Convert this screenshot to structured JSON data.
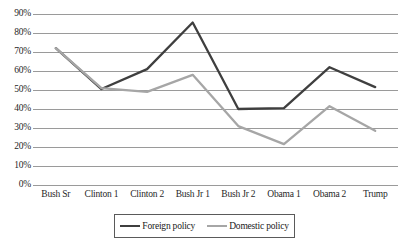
{
  "chart_data": {
    "type": "line",
    "title": "",
    "subtitle": "",
    "xlabel": "",
    "ylabel": "",
    "ylim": [
      0,
      90
    ],
    "ytick_step": 10,
    "ytick_labels": [
      "0%",
      "10%",
      "20%",
      "30%",
      "40%",
      "50%",
      "60%",
      "70%",
      "80%",
      "90%"
    ],
    "ytick_values": [
      0,
      10,
      20,
      30,
      40,
      50,
      60,
      70,
      80,
      90
    ],
    "grid": "horizontal",
    "legend_position": "bottom",
    "categories": [
      "Bush Sr",
      "Clinton 1",
      "Clinton 2",
      "Bush Jr 1",
      "Bush Jr 2",
      "Obama 1",
      "Obama 2",
      "Trump"
    ],
    "series": [
      {
        "name": "Foreign policy",
        "color": "#3f3f3f",
        "values": [
          72,
          50.5,
          61,
          85.5,
          40,
          40.5,
          62,
          51.5
        ]
      },
      {
        "name": "Domestic policy",
        "color": "#a6a6a6",
        "values": [
          72,
          51,
          49,
          58,
          31,
          21.5,
          41.5,
          28.5
        ]
      }
    ]
  },
  "legend": {
    "entries": [
      {
        "label": "Foreign policy"
      },
      {
        "label": "Domestic policy"
      }
    ]
  }
}
